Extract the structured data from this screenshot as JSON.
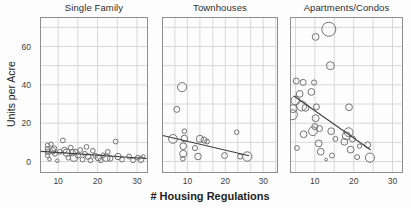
{
  "figure": {
    "background": "#fdfdfd"
  },
  "chart_data": {
    "type": "scatter",
    "layout": "three small-multiple bubble scatter panels with shared y-axis and fitted trend lines",
    "xlabel": "# Housing Regulations",
    "ylabel": "Units per Acre",
    "x_ticks": [
      10,
      20,
      30
    ],
    "y_ticks": [
      0,
      20,
      40,
      60
    ],
    "ylim": [
      -6,
      75.4
    ],
    "y_gridlines": [
      0,
      10,
      20,
      30,
      40,
      50,
      60,
      70
    ],
    "grid": true,
    "legend": false,
    "colors": {
      "bubble_stroke": "#737373",
      "trend_line": "#3f3f3f",
      "gridline": "#d8d8d8",
      "frame": "#8f8f8f",
      "tick_text": "#3d3d3d",
      "label_text": "#1f1f1f",
      "background": "#fdfdfd"
    },
    "point_format": "[x_regulations, y_units_per_acre, bubble_radius_px]",
    "panels": [
      {
        "title": "Single Family",
        "xlim": [
          5.4,
          32.8
        ],
        "x_gridlines": [
          10,
          15,
          20,
          25,
          30
        ],
        "trend": [
          [
            5.6,
            5.3
          ],
          [
            32.5,
            1.6
          ]
        ],
        "points": [
          [
            7.3,
            8.5,
            2.2
          ],
          [
            7.3,
            6.5,
            2.4
          ],
          [
            7.5,
            5,
            2.8
          ],
          [
            7.3,
            3.2,
            2.2
          ],
          [
            7.8,
            1.2,
            1.8
          ],
          [
            8.2,
            9,
            2.2
          ],
          [
            8.6,
            5.6,
            3.2
          ],
          [
            9,
            6.8,
            2.6
          ],
          [
            9.2,
            4,
            2.4
          ],
          [
            9.8,
            0.4,
            1.8
          ],
          [
            10.4,
            5,
            2.4
          ],
          [
            11.2,
            11,
            2.4
          ],
          [
            11.6,
            6,
            2.8
          ],
          [
            12.2,
            4.6,
            3.8
          ],
          [
            12.6,
            2,
            2.4
          ],
          [
            13.2,
            7.2,
            2.4
          ],
          [
            13.6,
            4.6,
            3.2
          ],
          [
            14,
            2,
            3.8
          ],
          [
            14.4,
            5.2,
            2.4
          ],
          [
            15,
            3.2,
            2.8
          ],
          [
            15.6,
            6,
            2.4
          ],
          [
            16.2,
            1,
            2.4
          ],
          [
            16.8,
            4,
            2.4
          ],
          [
            17.2,
            7.6,
            2.4
          ],
          [
            17.6,
            2.6,
            2.8
          ],
          [
            18.2,
            0.6,
            2.4
          ],
          [
            18.8,
            5.6,
            2.4
          ],
          [
            19.4,
            3,
            2.4
          ],
          [
            20.2,
            2,
            3.2
          ],
          [
            20.8,
            0.6,
            2.4
          ],
          [
            21.4,
            3.2,
            2.4
          ],
          [
            22.2,
            2,
            3.8
          ],
          [
            22.6,
            5,
            2.4
          ],
          [
            23.2,
            1.6,
            2.8
          ],
          [
            24.6,
            10.4,
            2.4
          ],
          [
            25.2,
            2.6,
            3.2
          ],
          [
            26.2,
            1,
            2.4
          ],
          [
            28,
            2.6,
            2.4
          ],
          [
            29,
            0.6,
            2.4
          ],
          [
            30.2,
            2,
            2.4
          ],
          [
            31,
            1,
            3
          ],
          [
            31.6,
            2.6,
            1.8
          ]
        ]
      },
      {
        "title": "Townhouses",
        "xlim": [
          3.3,
          33.9
        ],
        "x_gridlines": [
          6.7,
          10,
          13.3,
          16.7,
          20,
          23.3,
          26.7,
          30,
          33.3
        ],
        "trend": [
          [
            3.5,
            13.6
          ],
          [
            26.3,
            3.0
          ]
        ],
        "points": [
          [
            6.2,
            11.8,
            4.4
          ],
          [
            7.2,
            27.2,
            3
          ],
          [
            8.6,
            38.8,
            4.6
          ],
          [
            9.2,
            15.8,
            2.3
          ],
          [
            9.2,
            12,
            3.3
          ],
          [
            8.9,
            8,
            3.3
          ],
          [
            8.9,
            4,
            3.6
          ],
          [
            8.8,
            1.4,
            2.3
          ],
          [
            12,
            7,
            2.6
          ],
          [
            12.8,
            2.6,
            3.3
          ],
          [
            13.3,
            11.8,
            3.6
          ],
          [
            14.4,
            11.2,
            3
          ],
          [
            15.2,
            10.4,
            2.4
          ],
          [
            19.8,
            3.1,
            3
          ],
          [
            23,
            15.3,
            2.3
          ],
          [
            23.9,
            2.6,
            2.6
          ],
          [
            25.8,
            2.6,
            4.7
          ]
        ]
      },
      {
        "title": "Apartments/Condos",
        "xlim": [
          3.6,
          32.7
        ],
        "x_gridlines": [
          5,
          10,
          15,
          20,
          25,
          30
        ],
        "trend": [
          [
            4.6,
            34.2
          ],
          [
            24.4,
            6.0
          ]
        ],
        "points": [
          [
            13.6,
            69,
            7
          ],
          [
            10.2,
            65,
            3.4
          ],
          [
            14,
            50,
            4
          ],
          [
            5.2,
            42,
            3
          ],
          [
            7,
            41.3,
            3
          ],
          [
            9.8,
            41.2,
            2.6
          ],
          [
            9.1,
            36.3,
            3.4
          ],
          [
            6.1,
            35.3,
            3.4
          ],
          [
            5,
            31.8,
            4.4
          ],
          [
            4.4,
            27.6,
            4
          ],
          [
            4.2,
            24.4,
            5
          ],
          [
            6.6,
            29,
            5
          ],
          [
            7.6,
            28,
            3.4
          ],
          [
            10.4,
            28.5,
            3
          ],
          [
            10.2,
            22.6,
            3.5
          ],
          [
            9.5,
            15.8,
            4.4
          ],
          [
            10,
            18.2,
            3
          ],
          [
            11.2,
            17.2,
            3
          ],
          [
            7.1,
            14.2,
            3.4
          ],
          [
            11,
            9.4,
            3.4
          ],
          [
            11.5,
            5.1,
            3.4
          ],
          [
            5.4,
            7,
            2.4
          ],
          [
            12.9,
            1,
            1.4
          ],
          [
            14.2,
            15.8,
            3.4
          ],
          [
            15.3,
            11.8,
            2.5
          ],
          [
            14.4,
            3.1,
            2.5
          ],
          [
            18.8,
            28.3,
            3.4
          ],
          [
            18.1,
            13.4,
            4
          ],
          [
            18.7,
            15.3,
            4.4
          ],
          [
            17.6,
            10.3,
            3.4
          ],
          [
            19.2,
            6.2,
            3.4
          ],
          [
            19.7,
            11.8,
            3
          ],
          [
            20.9,
            2.3,
            2.5
          ],
          [
            23.6,
            8.7,
            3
          ],
          [
            24.2,
            2,
            4.6
          ],
          [
            21.5,
            8,
            2.2
          ]
        ]
      }
    ]
  }
}
